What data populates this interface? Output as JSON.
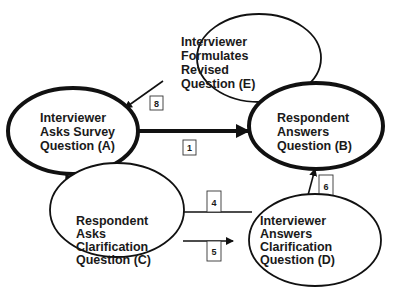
{
  "diagram": {
    "nodes": [
      {
        "id": "A",
        "lines": [
          "Interviewer",
          "Asks Survey",
          "Question (A)"
        ],
        "emphasis": "thick"
      },
      {
        "id": "B",
        "lines": [
          "Respondent",
          "Answers",
          "Question (B)"
        ],
        "emphasis": "thick"
      },
      {
        "id": "C",
        "lines": [
          "Respondent",
          "Asks",
          "Clarification",
          "Question (C)"
        ],
        "emphasis": "thin"
      },
      {
        "id": "D",
        "lines": [
          "Interviewer",
          "Answers",
          "Clarification",
          "Question (D)"
        ],
        "emphasis": "thin"
      },
      {
        "id": "E",
        "lines": [
          "Interviewer",
          "Formulates",
          "Revised",
          "Question (E)"
        ],
        "emphasis": "thin"
      }
    ],
    "edges": [
      {
        "label": "1",
        "from": "A",
        "to": "B",
        "emphasis": "thick"
      },
      {
        "label": "2",
        "from": "A",
        "to": "C"
      },
      {
        "label": "3",
        "from": "C",
        "to": "A"
      },
      {
        "label": "4",
        "from": "D",
        "to": "C"
      },
      {
        "label": "5",
        "from": "C",
        "to": "D"
      },
      {
        "label": "6",
        "from": "D",
        "to": "B"
      },
      {
        "label": "7",
        "from": "B",
        "to": "E"
      },
      {
        "label": "8",
        "from": "E",
        "to": "A"
      }
    ],
    "colors": {
      "stroke": "#111111",
      "text": "#1a1a1a",
      "background": "#ffffff"
    }
  }
}
